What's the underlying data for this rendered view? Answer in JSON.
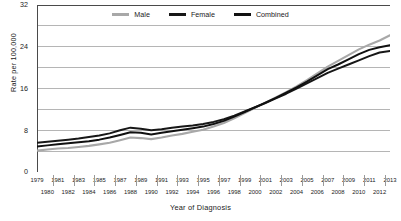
{
  "chart_data": {
    "type": "line",
    "title": "",
    "xlabel": "Year of Diagnosis",
    "ylabel": "Rate per 100,000",
    "xlim": [
      1979,
      2013
    ],
    "ylim": [
      0,
      32
    ],
    "yticks": [
      0,
      8,
      16,
      24,
      32
    ],
    "yticks_minor": [
      4,
      12,
      20,
      28
    ],
    "grid": "horizontal-major-and-minor",
    "legend_position": "top-center",
    "x": [
      1979,
      1980,
      1981,
      1982,
      1983,
      1984,
      1985,
      1986,
      1987,
      1988,
      1989,
      1990,
      1991,
      1992,
      1993,
      1994,
      1995,
      1996,
      1997,
      1998,
      1999,
      2000,
      2001,
      2002,
      2003,
      2004,
      2005,
      2006,
      2007,
      2008,
      2009,
      2010,
      2011,
      2012,
      2013
    ],
    "xticklabels_odd": [
      "1979",
      "1981",
      "1983",
      "1985",
      "1987",
      "1989",
      "1991",
      "1993",
      "1995",
      "1997",
      "1999",
      "2001",
      "2003",
      "2005",
      "2007",
      "2009",
      "2011",
      "2013"
    ],
    "xticklabels_even": [
      "1980",
      "1982",
      "1984",
      "1986",
      "1988",
      "1990",
      "1992",
      "1994",
      "1996",
      "1998",
      "2000",
      "2002",
      "2004",
      "2006",
      "2008",
      "2010",
      "2012"
    ],
    "series": [
      {
        "name": "Male",
        "color": "#a8a8a8",
        "values": [
          4.1,
          4.3,
          4.5,
          4.6,
          4.8,
          5.0,
          5.3,
          5.6,
          6.1,
          6.6,
          6.5,
          6.3,
          6.6,
          7.0,
          7.3,
          7.7,
          8.1,
          8.7,
          9.4,
          10.3,
          11.3,
          12.3,
          13.3,
          14.3,
          15.3,
          16.4,
          17.6,
          18.9,
          20.2,
          21.3,
          22.4,
          23.5,
          24.4,
          25.2,
          26.2
        ]
      },
      {
        "name": "Female",
        "color": "#171717",
        "values": [
          5.6,
          5.8,
          6.0,
          6.2,
          6.4,
          6.7,
          7.0,
          7.4,
          8.0,
          8.5,
          8.3,
          8.0,
          8.2,
          8.5,
          8.7,
          8.9,
          9.2,
          9.6,
          10.1,
          10.8,
          11.6,
          12.4,
          13.2,
          14.1,
          15.0,
          16.0,
          17.0,
          18.0,
          19.0,
          19.8,
          20.6,
          21.4,
          22.2,
          22.9,
          23.2
        ]
      },
      {
        "name": "Combined",
        "color": "#111111",
        "values": [
          4.9,
          5.1,
          5.3,
          5.5,
          5.7,
          5.9,
          6.2,
          6.6,
          7.1,
          7.6,
          7.5,
          7.2,
          7.5,
          7.8,
          8.1,
          8.4,
          8.7,
          9.2,
          9.8,
          10.6,
          11.5,
          12.4,
          13.3,
          14.2,
          15.2,
          16.2,
          17.3,
          18.5,
          19.7,
          20.6,
          21.6,
          22.6,
          23.4,
          23.9,
          24.3
        ]
      }
    ]
  },
  "legend": {
    "items": [
      {
        "label": "Male"
      },
      {
        "label": "Female"
      },
      {
        "label": "Combined"
      }
    ]
  },
  "axis": {
    "frame_color": "#4a4a4a",
    "grid_color": "#b5b5b5"
  }
}
